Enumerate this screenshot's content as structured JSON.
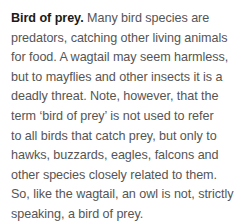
{
  "article": {
    "heading": "Bird of prey.",
    "first_line_rest": " Many bird species are",
    "lines": [
      "predators, catching other living animals",
      "for food. A wagtail may seem harmless,",
      "but to mayflies and other insects it is a",
      "deadly threat. Note, however, that the",
      "term ‘bird of prey’ is not used to refer",
      "to all birds that catch prey, but only to",
      "hawks, buzzards, eagles, falcons and",
      "other species closely related to them.",
      "So, like the wagtail, an owl is not, strictly",
      "speaking, a bird of prey."
    ]
  }
}
